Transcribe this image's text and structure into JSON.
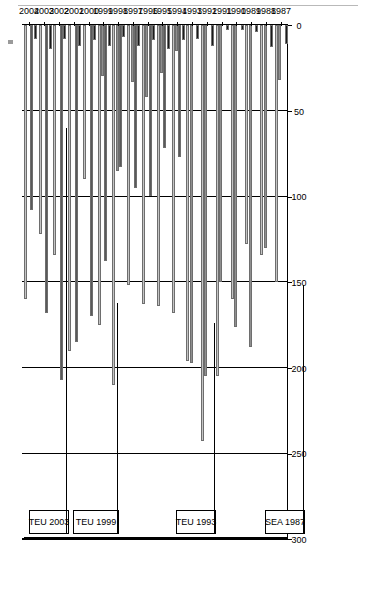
{
  "chart_data": {
    "type": "bar",
    "orientation": "rotated-90",
    "title": "",
    "xlabel": "",
    "ylabel": "",
    "ylim": [
      0,
      300
    ],
    "yticks": [
      0,
      50,
      100,
      150,
      200,
      250,
      300
    ],
    "grid": true,
    "legend_position": "bottom-right",
    "categories": [
      "1987",
      "1988",
      "1989",
      "1990",
      "1991",
      "1992",
      "1993",
      "1994",
      "1995",
      "1996",
      "1997",
      "1998",
      "1999",
      "2000",
      "2001",
      "2002",
      "2003",
      "2004"
    ],
    "series": [
      {
        "name": "Consultation",
        "color": "#c4c4c4",
        "values": [
          150,
          134,
          128,
          160,
          205,
          243,
          196,
          168,
          164,
          163,
          152,
          210,
          175,
          90,
          190,
          134,
          122,
          160
        ]
      },
      {
        "name": "Cooperation",
        "color": "#8f8f8f",
        "values": [
          32,
          130,
          188,
          176,
          150,
          205,
          197,
          15,
          28,
          42,
          33,
          85,
          30,
          0,
          0,
          0,
          0,
          0
        ]
      },
      {
        "name": "Co-decision",
        "color": "#595959",
        "values": [
          0,
          0,
          0,
          0,
          0,
          0,
          0,
          77,
          72,
          100,
          95,
          83,
          138,
          170,
          185,
          207,
          168,
          108
        ]
      },
      {
        "name": "Assent",
        "color": "#1a1a1a",
        "values": [
          11,
          13,
          4,
          3,
          3,
          12,
          8,
          9,
          14,
          9,
          12,
          7,
          12,
          9,
          12,
          8,
          14,
          8
        ]
      }
    ],
    "annotations": [
      {
        "label": "SEA 1987",
        "start_category": "1987",
        "end_category": "1988"
      },
      {
        "label": "TEU 1993",
        "start_category": "1993",
        "end_category": "1994"
      },
      {
        "label": "TEU 1999",
        "start_category": "1999",
        "end_category": "2001"
      },
      {
        "label": "TEU 2003",
        "start_category": "2003",
        "end_category": "2004"
      }
    ]
  },
  "axis": {
    "tick_0": "0",
    "tick_50": "50",
    "tick_100": "100",
    "tick_150": "150",
    "tick_200": "200",
    "tick_250": "250",
    "tick_300": "300"
  },
  "years": {
    "y1987": "1987",
    "y1988": "1988",
    "y1989": "1989",
    "y1990": "1990",
    "y1991": "1991",
    "y1992": "1992",
    "y1993": "1993",
    "y1994": "1994",
    "y1995": "1995",
    "y1996": "1996",
    "y1997": "1997",
    "y1998": "1998",
    "y1999": "1999",
    "y2000": "2000",
    "y2001": "2001",
    "y2002": "2002",
    "y2003": "2003",
    "y2004": "2004"
  },
  "periods": {
    "sea_1987": "SEA 1987",
    "teu_1993": "TEU 1993",
    "teu_1999": "TEU 1999",
    "teu_2003": "TEU 2003"
  },
  "legend": {
    "consultation": "Consultation",
    "cooperation": "Cooperation",
    "codecision": "Co-decision",
    "assent": "Assent"
  }
}
